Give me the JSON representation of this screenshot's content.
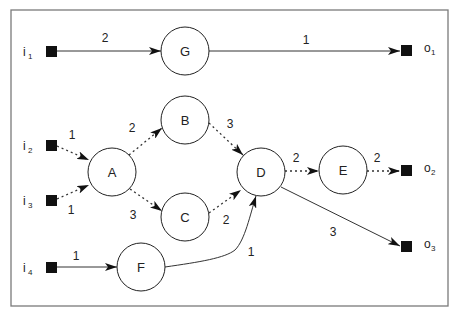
{
  "diagram": {
    "type": "directed-graph",
    "frame": {
      "x": 11,
      "y": 10,
      "width": 437,
      "height": 296,
      "stroke": "#7a7a7a"
    },
    "nodes": [
      {
        "id": "G",
        "label": "G",
        "cx": 185,
        "cy": 51
      },
      {
        "id": "B",
        "label": "B",
        "cx": 185,
        "cy": 120
      },
      {
        "id": "A",
        "label": "A",
        "cx": 112,
        "cy": 172
      },
      {
        "id": "C",
        "label": "C",
        "cx": 185,
        "cy": 217
      },
      {
        "id": "D",
        "label": "D",
        "cx": 261,
        "cy": 172
      },
      {
        "id": "E",
        "label": "E",
        "cx": 343,
        "cy": 170
      },
      {
        "id": "F",
        "label": "F",
        "cx": 141,
        "cy": 267
      }
    ],
    "inputs": [
      {
        "id": "i1",
        "letter": "i",
        "sub": "1",
        "x": 51,
        "y": 51
      },
      {
        "id": "i2",
        "letter": "i",
        "sub": "2",
        "x": 51,
        "y": 145
      },
      {
        "id": "i3",
        "letter": "i",
        "sub": "3",
        "x": 51,
        "y": 200
      },
      {
        "id": "i4",
        "letter": "i",
        "sub": "4",
        "x": 51,
        "y": 267
      }
    ],
    "outputs": [
      {
        "id": "o1",
        "letter": "o",
        "sub": "1",
        "x": 406,
        "y": 51
      },
      {
        "id": "o2",
        "letter": "o",
        "sub": "2",
        "x": 406,
        "y": 171
      },
      {
        "id": "o3",
        "letter": "o",
        "sub": "3",
        "x": 406,
        "y": 247
      }
    ],
    "edges": [
      {
        "from": "i1",
        "to": "G",
        "weight": "2",
        "style": "solid"
      },
      {
        "from": "G",
        "to": "o1",
        "weight": "1",
        "style": "solid"
      },
      {
        "from": "i2",
        "to": "A",
        "weight": "1",
        "style": "dashed"
      },
      {
        "from": "i3",
        "to": "A",
        "weight": "1",
        "style": "dashed"
      },
      {
        "from": "A",
        "to": "B",
        "weight": "2",
        "style": "dashed"
      },
      {
        "from": "A",
        "to": "C",
        "weight": "3",
        "style": "dashed"
      },
      {
        "from": "B",
        "to": "D",
        "weight": "3",
        "style": "dashed"
      },
      {
        "from": "C",
        "to": "D",
        "weight": "2",
        "style": "dashed"
      },
      {
        "from": "D",
        "to": "E",
        "weight": "2",
        "style": "dashed"
      },
      {
        "from": "E",
        "to": "o2",
        "weight": "2",
        "style": "dashed"
      },
      {
        "from": "D",
        "to": "o3",
        "weight": "3",
        "style": "solid"
      },
      {
        "from": "i4",
        "to": "F",
        "weight": "1",
        "style": "solid"
      },
      {
        "from": "F",
        "to": "D",
        "weight": "1",
        "style": "solid-curved"
      }
    ]
  }
}
